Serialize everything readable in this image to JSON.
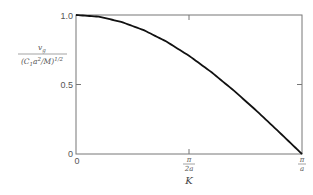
{
  "chart_data": {
    "type": "line",
    "title": "",
    "xlabel": "K",
    "ylabel": "v_g / (C_1 a^2 / M)^(1/2)",
    "ylabel_parts": {
      "numerator": "v",
      "numerator_sub": "g",
      "denominator_a": "(C",
      "denominator_sub": "1",
      "denominator_b": "a",
      "denominator_sup2": "2",
      "denominator_c": "/M)",
      "denominator_sup": "1/2"
    },
    "x_ticks": [
      {
        "value": 0,
        "label": "0"
      },
      {
        "value": 0.5,
        "label_num": "π",
        "label_den": "2a"
      },
      {
        "value": 1.0,
        "label_num": "π",
        "label_den": "a"
      }
    ],
    "y_ticks": [
      {
        "value": 0,
        "label": "0"
      },
      {
        "value": 0.5,
        "label": "0.5"
      },
      {
        "value": 1.0,
        "label": "1.0"
      }
    ],
    "xlim": [
      0,
      1
    ],
    "xlim_note": "x in units of π/a",
    "ylim": [
      0,
      1
    ],
    "grid": false,
    "legend": null,
    "series": [
      {
        "name": "group velocity",
        "x": [
          0,
          0.1,
          0.2,
          0.3,
          0.4,
          0.5,
          0.6,
          0.7,
          0.8,
          0.9,
          1.0
        ],
        "y": [
          1.0,
          0.988,
          0.951,
          0.891,
          0.809,
          0.707,
          0.588,
          0.454,
          0.309,
          0.156,
          0.0
        ]
      }
    ]
  }
}
